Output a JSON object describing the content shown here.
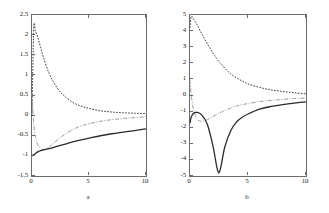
{
  "figure": {
    "background": "#ffffff",
    "axis_color": "#6b6b6b",
    "panels": [
      {
        "caption": "a",
        "chart_data": {
          "type": "line",
          "title": "",
          "xlabel": "",
          "ylabel": "",
          "xlim": [
            0,
            10
          ],
          "ylim": [
            -1.5,
            2.5
          ],
          "xticks": [
            0,
            5,
            10
          ],
          "xticklabels": [
            "0",
            "5",
            "10"
          ],
          "yticks": [
            -1.5,
            -1,
            -0.5,
            0,
            0.5,
            1,
            1.5,
            2,
            2.5
          ],
          "yticklabels": [
            "-1.5",
            "-1",
            "-0.5",
            "0",
            "0.5",
            "1",
            "1.5",
            "2",
            "2.5"
          ],
          "grid": false,
          "legend": "none",
          "x": [
            0,
            0.15,
            0.3,
            0.5,
            0.75,
            1,
            1.5,
            2,
            2.5,
            3,
            3.5,
            4,
            4.5,
            5,
            6,
            7,
            8,
            9,
            10
          ],
          "series": [
            {
              "name": "dotted-curve",
              "style": "dotted",
              "color": "#3a3a3a",
              "values": [
                0.0,
                2.15,
                2.1,
                1.95,
                1.7,
                1.45,
                1.05,
                0.78,
                0.58,
                0.45,
                0.34,
                0.27,
                0.22,
                0.18,
                0.12,
                0.09,
                0.07,
                0.06,
                0.05
              ]
            },
            {
              "name": "dash-dot-curve",
              "style": "dashdot",
              "color": "#9a9a9a",
              "values": [
                0.55,
                -0.2,
                -0.52,
                -0.72,
                -0.82,
                -0.85,
                -0.78,
                -0.66,
                -0.54,
                -0.44,
                -0.36,
                -0.29,
                -0.24,
                -0.2,
                -0.14,
                -0.1,
                -0.07,
                -0.05,
                -0.03
              ]
            },
            {
              "name": "solid-curve",
              "style": "solid",
              "color": "#2b2b2b",
              "values": [
                -1.0,
                -0.97,
                -0.94,
                -0.9,
                -0.87,
                -0.85,
                -0.82,
                -0.78,
                -0.74,
                -0.7,
                -0.66,
                -0.62,
                -0.59,
                -0.56,
                -0.5,
                -0.45,
                -0.41,
                -0.37,
                -0.33
              ]
            }
          ]
        }
      },
      {
        "caption": "b",
        "chart_data": {
          "type": "line",
          "title": "",
          "xlabel": "",
          "ylabel": "",
          "xlim": [
            0,
            10
          ],
          "ylim": [
            -5,
            5
          ],
          "xticks": [
            0,
            5,
            10
          ],
          "xticklabels": [
            "0",
            "5",
            "10"
          ],
          "yticks": [
            -5,
            -4,
            -3,
            -2,
            -1,
            0,
            1,
            2,
            3,
            4,
            5
          ],
          "yticklabels": [
            "-5",
            "-4",
            "-3",
            "-2",
            "-1",
            "0",
            "1",
            "2",
            "3",
            "4",
            "5"
          ],
          "grid": false,
          "legend": "none",
          "x": [
            0,
            0.1,
            0.3,
            0.6,
            1,
            1.5,
            2,
            2.3,
            2.5,
            2.7,
            3,
            3.5,
            4,
            4.5,
            5,
            6,
            7,
            8,
            9,
            10
          ],
          "series": [
            {
              "name": "dotted-curve",
              "style": "dotted",
              "color": "#3a3a3a",
              "values": [
                4.2,
                4.9,
                4.75,
                4.4,
                3.85,
                3.2,
                2.6,
                2.3,
                2.1,
                1.95,
                1.7,
                1.35,
                1.1,
                0.9,
                0.72,
                0.5,
                0.35,
                0.25,
                0.17,
                0.1
              ]
            },
            {
              "name": "dash-dot-curve",
              "style": "dashdot",
              "color": "#9a9a9a",
              "values": [
                0.95,
                0.1,
                -0.85,
                -1.45,
                -1.6,
                -1.5,
                -1.3,
                -1.18,
                -1.1,
                -1.03,
                -0.93,
                -0.78,
                -0.66,
                -0.57,
                -0.5,
                -0.38,
                -0.3,
                -0.24,
                -0.19,
                -0.15
              ]
            },
            {
              "name": "solid-curve",
              "style": "solid",
              "color": "#2b2b2b",
              "values": [
                -1.7,
                -1.35,
                -1.1,
                -1.05,
                -1.2,
                -1.8,
                -3.2,
                -4.4,
                -4.8,
                -4.3,
                -3.2,
                -2.2,
                -1.65,
                -1.35,
                -1.15,
                -0.85,
                -0.68,
                -0.56,
                -0.47,
                -0.4
              ]
            }
          ]
        }
      }
    ]
  }
}
